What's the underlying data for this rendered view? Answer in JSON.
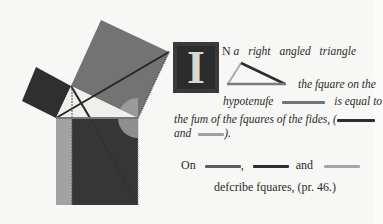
{
  "dropcap": {
    "letter": "I"
  },
  "text": {
    "line1_cap": "N",
    "line1": "a  right  angled  triangle",
    "line2": "the fquare on the",
    "line3a": "hypotenufe",
    "line3b": "is equal to",
    "line4": "the fum of the fquares of the fides, (",
    "line5a": "and",
    "line5b": ").",
    "line6a": "On",
    "line6b": ",",
    "line6c": "and",
    "line7": "defcribe fquares, (pr. 46.)"
  },
  "colors": {
    "dark": "#2e2e2e",
    "mid": "#6a6a6a",
    "light": "#a8a8a8",
    "lighter": "#8c8c8c"
  }
}
